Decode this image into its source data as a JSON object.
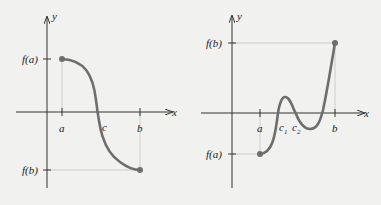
{
  "figures": [
    {
      "id": "left",
      "axes": {
        "x_label": "x",
        "y_label": "y"
      },
      "x_ticks": [
        {
          "label": "a"
        },
        {
          "label": "b"
        }
      ],
      "point_labels": [
        {
          "label": "c"
        }
      ],
      "y_ticks": [
        {
          "label": "f(a)"
        },
        {
          "label": "f(b)"
        }
      ],
      "description": "Decreasing curve from (a, f(a)) above axis to (b, f(b)) below, crossing x-axis at c"
    },
    {
      "id": "right",
      "axes": {
        "x_label": "x",
        "y_label": "y"
      },
      "x_ticks": [
        {
          "label": "a"
        },
        {
          "label": "b"
        }
      ],
      "point_labels": [
        {
          "label": "c",
          "sub": "1"
        },
        {
          "label": "c",
          "sub": "2"
        }
      ],
      "y_ticks": [
        {
          "label": "f(b)"
        },
        {
          "label": "f(a)"
        }
      ],
      "description": "Curve from (a, f(a)) below axis rising through c1, dipping through c2, rising to (b, f(b))"
    }
  ],
  "colors": {
    "curve": "#6e6e6e",
    "axis": "#333333",
    "guide": "#bdbdbd",
    "background": "#f1f1ef"
  }
}
